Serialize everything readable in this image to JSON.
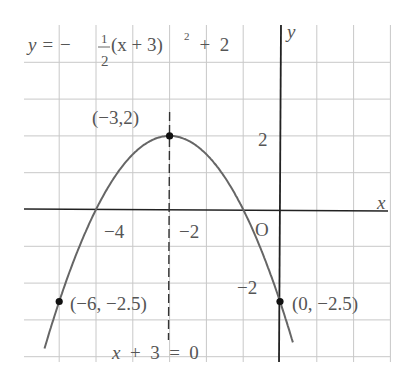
{
  "chart_data": {
    "type": "line",
    "equation": {
      "prefix": "y  =  −",
      "frac_num": "1",
      "frac_den": "2",
      "suffix": "(x  +  3)",
      "exp": "2",
      "tail": "  +  2"
    },
    "xlabel": "x",
    "ylabel": "y",
    "origin_label": "O",
    "xlim": [
      -6.5,
      3
    ],
    "ylim": [
      -4,
      5
    ],
    "grid": true,
    "x_ticks": [
      {
        "value": -4,
        "label": "−4"
      },
      {
        "value": -2,
        "label": "−2"
      }
    ],
    "y_ticks": [
      {
        "value": 2,
        "label": "2"
      },
      {
        "value": -2,
        "label": "−2"
      }
    ],
    "series": [
      {
        "name": "parabola",
        "function": "-0.5*(x+3)^2+2",
        "x_range": [
          -6.4,
          0.35
        ],
        "color": "#666666"
      }
    ],
    "points": [
      {
        "x": -3,
        "y": 2,
        "label": "(−3,2)"
      },
      {
        "x": -6,
        "y": -2.5,
        "label": "(−6, −2.5)"
      },
      {
        "x": 0,
        "y": -2.5,
        "label": "(0, −2.5)"
      }
    ],
    "axis_of_symmetry": {
      "x": -3,
      "label": "x  +  3  =  0",
      "style": "dashed"
    }
  }
}
